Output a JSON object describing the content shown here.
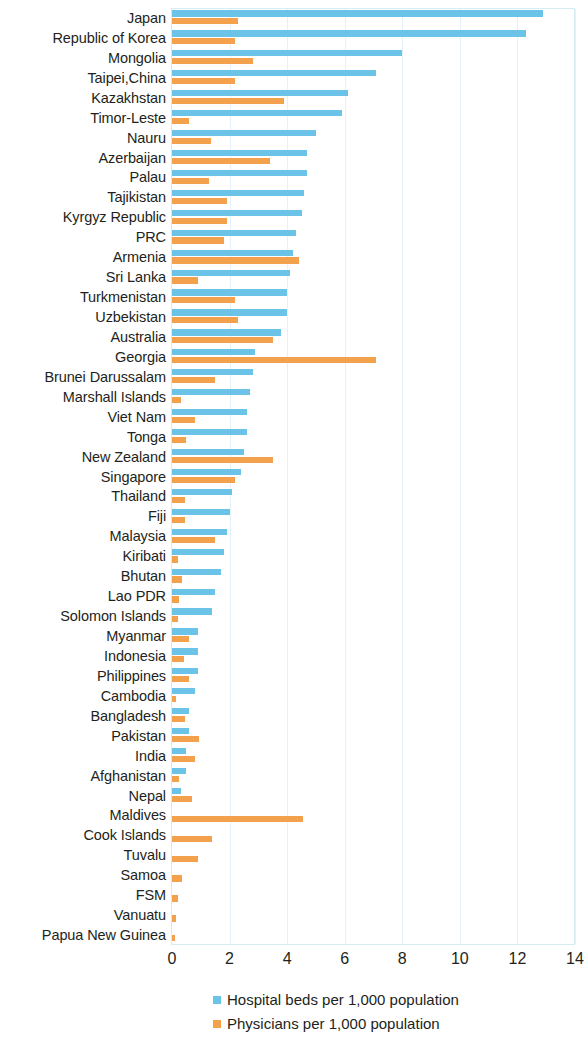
{
  "chart_data": {
    "type": "bar",
    "orientation": "horizontal",
    "title": "",
    "subtitle": "",
    "xlabel": "",
    "ylabel": "",
    "xlim": [
      0,
      14
    ],
    "xticks": [
      0,
      2,
      4,
      6,
      8,
      10,
      12,
      14
    ],
    "xtick_labels": [
      "0",
      "2",
      "4",
      "6",
      "8",
      "10",
      "12",
      "14"
    ],
    "grid": "vertical",
    "legend_position": "bottom",
    "colors": {
      "hospital_beds": "#6cc3e8",
      "physicians": "#f4a14e",
      "axis_text": "#231f20",
      "gridline": "#e4f1f8",
      "plot_border": "#d6ecf5"
    },
    "categories": [
      "Japan",
      "Republic of Korea",
      "Mongolia",
      "Taipei,China",
      "Kazakhstan",
      "Timor-Leste",
      "Nauru",
      "Azerbaijan",
      "Palau",
      "Tajikistan",
      "Kyrgyz Republic",
      "PRC",
      "Armenia",
      "Sri Lanka",
      "Turkmenistan",
      "Uzbekistan",
      "Australia",
      "Georgia",
      "Brunei Darussalam",
      "Marshall Islands",
      "Viet Nam",
      "Tonga",
      "New Zealand",
      "Singapore",
      "Thailand",
      "Fiji",
      "Malaysia",
      "Kiribati",
      "Bhutan",
      "Lao PDR",
      "Solomon Islands",
      "Myanmar",
      "Indonesia",
      "Philippines",
      "Cambodia",
      "Bangladesh",
      "Pakistan",
      "India",
      "Afghanistan",
      "Nepal",
      "Maldives",
      "Cook Islands",
      "Tuvalu",
      "Samoa",
      "FSM",
      "Vanuatu",
      "Papua New Guinea"
    ],
    "series": [
      {
        "name": "Hospital beds per 1,000 population",
        "color": "#6cc3e8",
        "values": [
          12.9,
          12.3,
          8.0,
          7.1,
          6.1,
          5.9,
          5.0,
          4.7,
          4.7,
          4.6,
          4.5,
          4.3,
          4.2,
          4.1,
          4.0,
          4.0,
          3.8,
          2.9,
          2.8,
          2.7,
          2.6,
          2.6,
          2.5,
          2.4,
          2.1,
          2.0,
          1.9,
          1.8,
          1.7,
          1.5,
          1.4,
          0.9,
          0.9,
          0.9,
          0.8,
          0.6,
          0.6,
          0.5,
          0.5,
          0.3,
          0.0,
          0.0,
          0.0,
          0.0,
          0.0,
          0.0,
          0.0
        ]
      },
      {
        "name": "Physicians per 1,000 population",
        "color": "#f4a14e",
        "values": [
          2.3,
          2.2,
          2.8,
          2.2,
          3.9,
          0.6,
          1.35,
          3.4,
          1.3,
          1.9,
          1.9,
          1.8,
          4.4,
          0.9,
          2.2,
          2.3,
          3.5,
          7.1,
          1.5,
          0.3,
          0.8,
          0.5,
          3.5,
          2.2,
          0.45,
          0.45,
          1.5,
          0.2,
          0.35,
          0.25,
          0.2,
          0.6,
          0.4,
          0.6,
          0.15,
          0.45,
          0.95,
          0.8,
          0.25,
          0.7,
          4.55,
          1.4,
          0.9,
          0.35,
          0.2,
          0.15,
          0.1
        ]
      }
    ]
  },
  "legend": {
    "items": [
      {
        "label": "Hospital beds per 1,000 population",
        "color_key": "blue"
      },
      {
        "label": "Physicians per 1,000 population",
        "color_key": "orange"
      }
    ]
  }
}
